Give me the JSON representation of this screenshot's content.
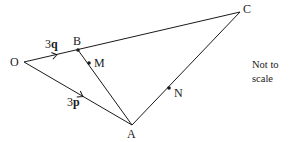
{
  "diagram": {
    "type": "vector-geometry",
    "points": {
      "O": {
        "label": "O",
        "x": 24,
        "y": 62
      },
      "B": {
        "label": "B",
        "x": 78,
        "y": 50
      },
      "C": {
        "label": "C",
        "x": 240,
        "y": 12
      },
      "A": {
        "label": "A",
        "x": 132,
        "y": 125
      },
      "M": {
        "label": "M",
        "x": 89,
        "y": 63
      },
      "N": {
        "label": "N",
        "x": 169,
        "y": 88
      }
    },
    "segments": [
      "O-C",
      "O-A",
      "B-A",
      "A-C"
    ],
    "vectors": {
      "OB": {
        "coef": "3",
        "symbol": "q",
        "label": "3q"
      },
      "OA": {
        "coef": "3",
        "symbol": "p",
        "label": "3p"
      }
    },
    "note": {
      "line1": "Not to",
      "line2": "scale"
    },
    "colors": {
      "stroke": "#1a1a1a",
      "background": "#ffffff"
    }
  }
}
